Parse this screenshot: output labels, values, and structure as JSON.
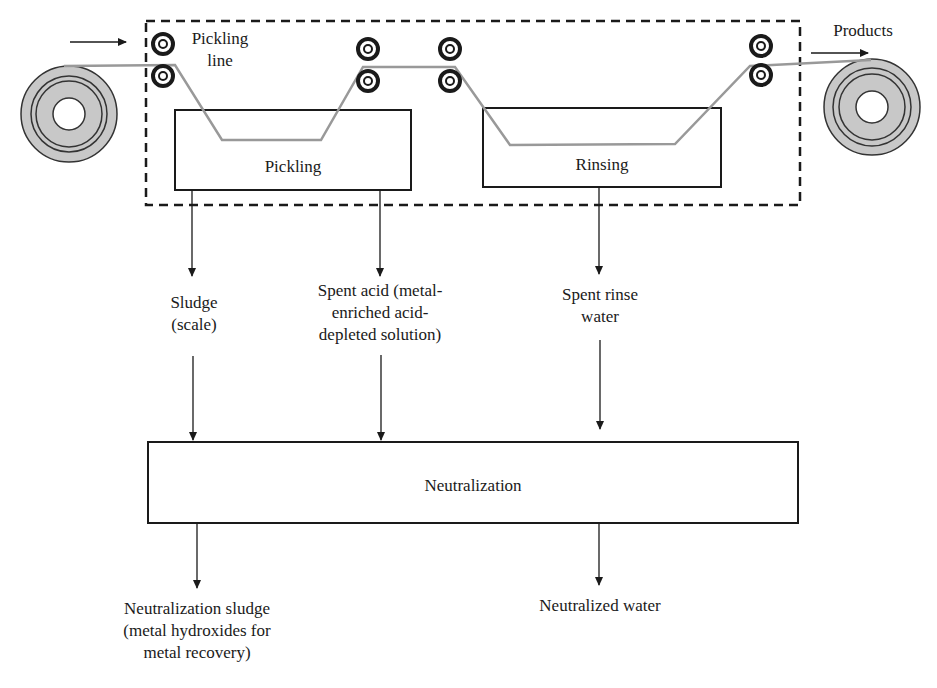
{
  "diagram": {
    "type": "process-flow",
    "boundary": {
      "label_lines": [
        "Pickling",
        "line"
      ],
      "style": "dashed"
    },
    "input_arrow": {
      "direction": "right"
    },
    "products": {
      "label": "Products"
    },
    "tanks": [
      {
        "id": "pickling",
        "label": "Pickling"
      },
      {
        "id": "rinsing",
        "label": "Rinsing"
      }
    ],
    "streams": {
      "sludge": {
        "lines": [
          "Sludge",
          "(scale)"
        ]
      },
      "spent_acid": {
        "lines": [
          "Spent acid (metal-",
          "enriched acid-",
          "depleted solution)"
        ]
      },
      "spent_rinse": {
        "lines": [
          "Spent rinse",
          "water"
        ]
      }
    },
    "neutralization": {
      "label": "Neutralization"
    },
    "outputs": {
      "neutralization_sludge": {
        "lines": [
          "Neutralization sludge",
          "(metal hydroxides for",
          "metal recovery)"
        ]
      },
      "neutralized_water": {
        "label": "Neutralized water"
      }
    },
    "colors": {
      "line": "#1a1a1a",
      "strip": "#999999",
      "coil_fill": "#c8c8c8"
    }
  }
}
